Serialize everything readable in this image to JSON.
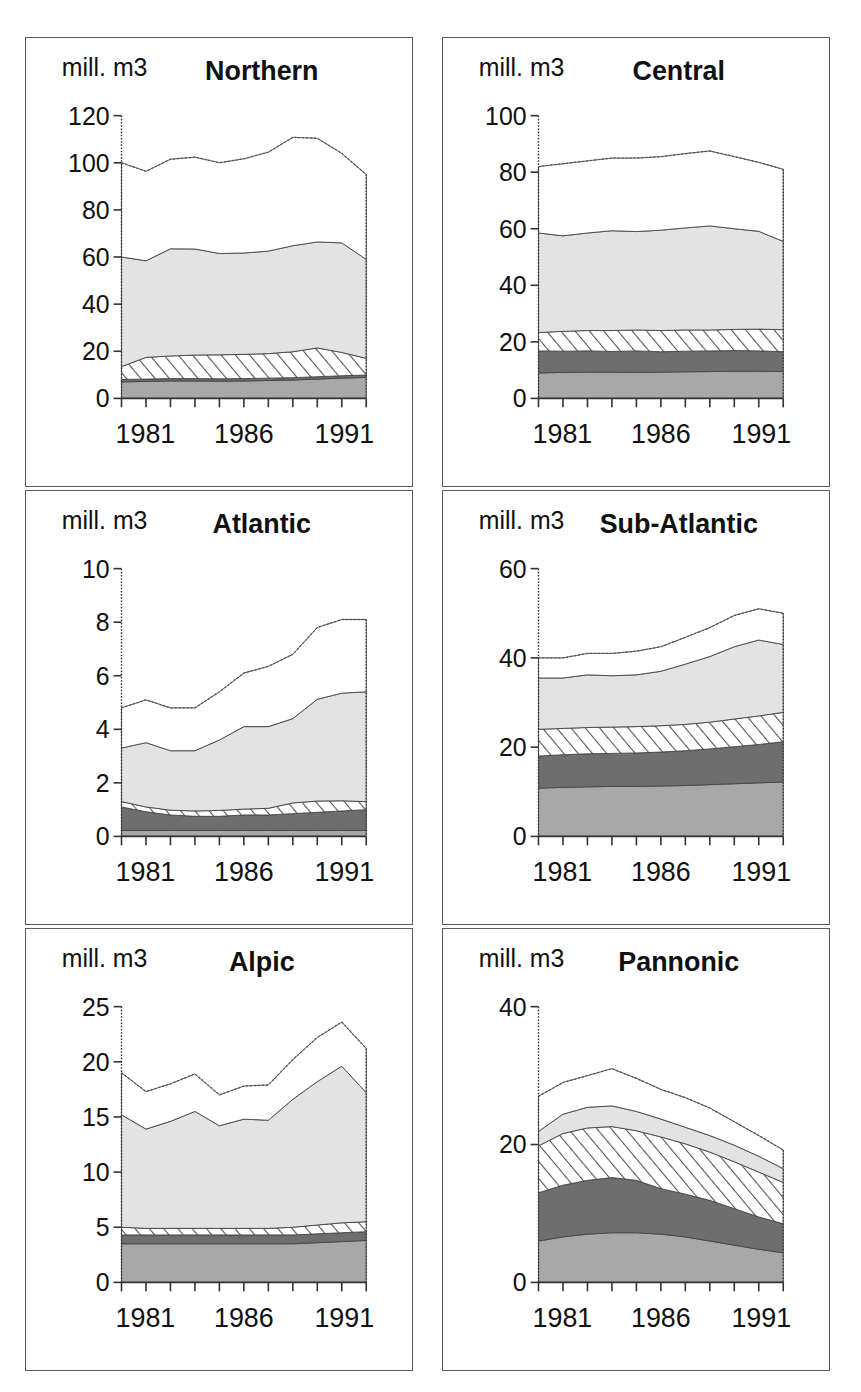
{
  "page": {
    "cropped_header_text": "",
    "unit_label": "mill. m3",
    "x_first": "1981",
    "x_mid": "1986",
    "x_last": "1991",
    "colors": {
      "layer1": "#a8a8a8",
      "layer2": "#6e6e6e",
      "layer3_hatch": "#ffffff",
      "layer4": "#e3e3e3",
      "layer5": "#ffffff",
      "panel_border": "#5a5a5a",
      "axis": "#333333"
    }
  },
  "chart_data": [
    {
      "type": "area",
      "title": "Northern",
      "ylabel": "mill. m3",
      "xlabel": "",
      "ylim": [
        0,
        120
      ],
      "yticks": [
        0,
        20,
        40,
        60,
        80,
        100,
        120
      ],
      "xticklabels": [
        "1981",
        "1986",
        "1991"
      ],
      "x": [
        1981,
        1982,
        1983,
        1984,
        1985,
        1986,
        1987,
        1988,
        1989,
        1990,
        1991
      ],
      "grid": false,
      "legend": "none",
      "stacked": true,
      "series": [
        {
          "name": "layer1",
          "values": [
            7.0,
            7.2,
            7.4,
            7.4,
            7.3,
            7.4,
            7.6,
            7.8,
            8.2,
            8.6,
            8.9
          ]
        },
        {
          "name": "layer2",
          "values": [
            1.0,
            1.0,
            1.0,
            1.0,
            1.0,
            1.0,
            1.0,
            1.0,
            1.0,
            1.0,
            1.0
          ]
        },
        {
          "name": "layer3",
          "values": [
            5.5,
            9.2,
            9.6,
            10.0,
            10.2,
            10.3,
            10.4,
            11.0,
            12.2,
            9.9,
            7.1
          ]
        },
        {
          "name": "layer4",
          "values": [
            46.5,
            41.0,
            45.5,
            45.0,
            43.0,
            43.0,
            43.5,
            45.0,
            45.0,
            46.5,
            42.0
          ]
        },
        {
          "name": "layer5",
          "values": [
            40.0,
            38.0,
            38.0,
            39.0,
            38.5,
            40.0,
            42.0,
            46.0,
            44.0,
            38.0,
            36.0
          ]
        }
      ],
      "totals": [
        100,
        96.4,
        101.5,
        102.4,
        100,
        101.7,
        104.5,
        110.8,
        110.4,
        104,
        95
      ]
    },
    {
      "type": "area",
      "title": "Central",
      "ylabel": "mill. m3",
      "xlabel": "",
      "ylim": [
        0,
        100
      ],
      "yticks": [
        0,
        20,
        40,
        60,
        80,
        100
      ],
      "xticklabels": [
        "1981",
        "1986",
        "1991"
      ],
      "x": [
        1981,
        1982,
        1983,
        1984,
        1985,
        1986,
        1987,
        1988,
        1989,
        1990,
        1991
      ],
      "grid": false,
      "legend": "none",
      "stacked": true,
      "series": [
        {
          "name": "layer1",
          "values": [
            9.0,
            9.2,
            9.3,
            9.3,
            9.2,
            9.3,
            9.4,
            9.5,
            9.6,
            9.6,
            9.5
          ]
        },
        {
          "name": "layer2",
          "values": [
            7.8,
            7.5,
            7.5,
            7.3,
            7.6,
            7.2,
            7.3,
            7.3,
            7.3,
            7.2,
            7.0
          ]
        },
        {
          "name": "layer3",
          "values": [
            6.5,
            7.0,
            7.2,
            7.4,
            7.4,
            7.5,
            7.5,
            7.4,
            7.5,
            7.7,
            7.8
          ]
        },
        {
          "name": "layer4",
          "values": [
            35.2,
            33.8,
            34.5,
            35.3,
            34.8,
            35.5,
            36.1,
            36.8,
            35.6,
            34.6,
            31.2
          ]
        },
        {
          "name": "layer5",
          "values": [
            23.5,
            25.5,
            25.5,
            25.7,
            26.0,
            26.0,
            26.3,
            26.5,
            25.5,
            24.4,
            25.5
          ]
        }
      ],
      "totals": [
        82,
        83,
        84,
        85,
        85,
        85.5,
        86.6,
        87.5,
        85.5,
        83.5,
        81
      ]
    },
    {
      "type": "area",
      "title": "Atlantic",
      "ylabel": "mill. m3",
      "xlabel": "",
      "ylim": [
        0,
        10
      ],
      "yticks": [
        0,
        2,
        4,
        6,
        8,
        10
      ],
      "xticklabels": [
        "1981",
        "1986",
        "1991"
      ],
      "x": [
        1981,
        1982,
        1983,
        1984,
        1985,
        1986,
        1987,
        1988,
        1989,
        1990,
        1991
      ],
      "grid": false,
      "legend": "none",
      "stacked": true,
      "series": [
        {
          "name": "layer1",
          "values": [
            0.22,
            0.22,
            0.22,
            0.22,
            0.22,
            0.22,
            0.22,
            0.22,
            0.22,
            0.22,
            0.22
          ]
        },
        {
          "name": "layer2",
          "values": [
            0.88,
            0.7,
            0.58,
            0.53,
            0.53,
            0.58,
            0.58,
            0.63,
            0.68,
            0.73,
            0.78
          ]
        },
        {
          "name": "layer3",
          "values": [
            0.2,
            0.18,
            0.18,
            0.2,
            0.22,
            0.22,
            0.25,
            0.4,
            0.42,
            0.38,
            0.3
          ]
        },
        {
          "name": "layer4",
          "values": [
            2.0,
            2.4,
            2.22,
            2.25,
            2.63,
            3.08,
            3.05,
            3.15,
            3.8,
            4.02,
            4.1
          ]
        },
        {
          "name": "layer5",
          "values": [
            1.5,
            1.6,
            1.6,
            1.6,
            1.8,
            2.0,
            2.25,
            2.4,
            2.68,
            2.75,
            2.7
          ]
        }
      ],
      "totals": [
        4.8,
        5.1,
        4.8,
        4.8,
        5.4,
        6.1,
        6.35,
        6.8,
        7.8,
        8.1,
        8.1
      ]
    },
    {
      "type": "area",
      "title": "Sub-Atlantic",
      "ylabel": "mill. m3",
      "xlabel": "",
      "ylim": [
        0,
        60
      ],
      "yticks": [
        0,
        20,
        40,
        60
      ],
      "xticklabels": [
        "1981",
        "1986",
        "1991"
      ],
      "x": [
        1981,
        1982,
        1983,
        1984,
        1985,
        1986,
        1987,
        1988,
        1989,
        1990,
        1991
      ],
      "grid": false,
      "legend": "none",
      "stacked": true,
      "series": [
        {
          "name": "layer1",
          "values": [
            10.8,
            11.0,
            11.1,
            11.2,
            11.2,
            11.3,
            11.4,
            11.6,
            11.8,
            12.0,
            12.2
          ]
        },
        {
          "name": "layer2",
          "values": [
            7.2,
            7.3,
            7.4,
            7.4,
            7.5,
            7.6,
            7.8,
            8.0,
            8.3,
            8.6,
            9.0
          ]
        },
        {
          "name": "layer3",
          "values": [
            6.0,
            5.9,
            5.9,
            5.9,
            5.9,
            5.9,
            5.9,
            6.0,
            6.2,
            6.4,
            6.6
          ]
        },
        {
          "name": "layer4",
          "values": [
            11.5,
            11.3,
            11.8,
            11.5,
            11.6,
            12.2,
            13.5,
            14.7,
            16.2,
            17.0,
            15.2
          ]
        },
        {
          "name": "layer5",
          "values": [
            4.5,
            4.5,
            4.8,
            5.0,
            5.3,
            5.5,
            6.0,
            6.5,
            7.0,
            7.0,
            7.0
          ]
        }
      ],
      "totals": [
        40,
        40,
        41,
        41,
        41.5,
        42.5,
        44.6,
        46.8,
        49.5,
        51,
        50
      ]
    },
    {
      "type": "area",
      "title": "Alpic",
      "ylabel": "mill. m3",
      "xlabel": "",
      "ylim": [
        0,
        25
      ],
      "yticks": [
        0,
        5,
        10,
        15,
        20,
        25
      ],
      "xticklabels": [
        "1981",
        "1986",
        "1991"
      ],
      "x": [
        1981,
        1982,
        1983,
        1984,
        1985,
        1986,
        1987,
        1988,
        1989,
        1990,
        1991
      ],
      "grid": false,
      "legend": "none",
      "stacked": true,
      "series": [
        {
          "name": "layer1",
          "values": [
            3.5,
            3.5,
            3.5,
            3.5,
            3.5,
            3.5,
            3.5,
            3.5,
            3.6,
            3.7,
            3.8
          ]
        },
        {
          "name": "layer2",
          "values": [
            0.8,
            0.8,
            0.8,
            0.8,
            0.8,
            0.8,
            0.8,
            0.8,
            0.8,
            0.8,
            0.8
          ]
        },
        {
          "name": "layer3",
          "values": [
            0.7,
            0.6,
            0.6,
            0.6,
            0.6,
            0.6,
            0.6,
            0.7,
            0.8,
            0.9,
            0.9
          ]
        },
        {
          "name": "layer4",
          "values": [
            10.2,
            9.0,
            9.7,
            10.6,
            9.3,
            9.9,
            9.8,
            11.6,
            13.0,
            14.2,
            11.7
          ]
        },
        {
          "name": "layer5",
          "values": [
            3.8,
            3.4,
            3.4,
            3.4,
            2.8,
            3.0,
            3.2,
            3.6,
            4.0,
            4.0,
            4.0
          ]
        }
      ],
      "totals": [
        19,
        17.3,
        18,
        18.9,
        17,
        17.8,
        17.9,
        20.2,
        22.2,
        23.6,
        21.2
      ]
    },
    {
      "type": "area",
      "title": "Pannonic",
      "ylabel": "mill. m3",
      "xlabel": "",
      "ylim": [
        0,
        40
      ],
      "yticks": [
        0,
        20,
        40
      ],
      "xticklabels": [
        "1981",
        "1986",
        "1991"
      ],
      "x": [
        1981,
        1982,
        1983,
        1984,
        1985,
        1986,
        1987,
        1988,
        1989,
        1990,
        1991
      ],
      "grid": false,
      "legend": "none",
      "stacked": true,
      "series": [
        {
          "name": "layer1",
          "values": [
            6.0,
            6.6,
            7.0,
            7.2,
            7.2,
            7.0,
            6.6,
            6.0,
            5.4,
            4.8,
            4.3
          ]
        },
        {
          "name": "layer2",
          "values": [
            7.0,
            7.5,
            7.8,
            8.0,
            7.6,
            6.6,
            6.2,
            5.9,
            5.3,
            4.7,
            4.2
          ]
        },
        {
          "name": "layer3",
          "values": [
            6.8,
            7.5,
            7.6,
            7.4,
            7.2,
            7.5,
            7.3,
            7.0,
            6.8,
            6.5,
            6.0
          ]
        },
        {
          "name": "layer4",
          "values": [
            2.1,
            2.8,
            3.0,
            3.0,
            2.8,
            2.6,
            2.4,
            2.4,
            2.4,
            2.3,
            2.0
          ]
        },
        {
          "name": "layer5",
          "values": [
            5.1,
            4.6,
            4.6,
            5.4,
            4.8,
            4.3,
            4.3,
            4.0,
            3.4,
            3.0,
            2.7
          ]
        }
      ],
      "totals": [
        27,
        29,
        30,
        31,
        29.6,
        28,
        26.8,
        25.3,
        23.3,
        21.3,
        19.2
      ]
    }
  ]
}
